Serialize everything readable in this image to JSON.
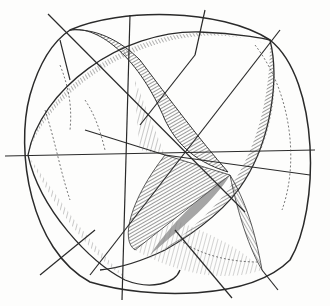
{
  "figure": {
    "title": "Sphere divided by three great circles (engraving)",
    "colors": {
      "ink": "#2a2a2a",
      "shade_dark": "#555555",
      "shade_mid": "#8a8a8a",
      "paper": "#fdfdfc"
    }
  }
}
